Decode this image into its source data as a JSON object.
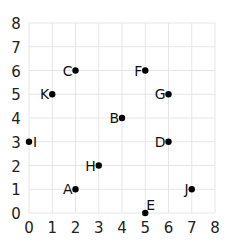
{
  "chart_data": {
    "type": "scatter",
    "title": "",
    "xlabel": "",
    "ylabel": "",
    "xlim": [
      0,
      8
    ],
    "ylim": [
      0,
      8
    ],
    "grid": true,
    "legend": "none",
    "x_ticks": [
      "0",
      "1",
      "2",
      "3",
      "4",
      "5",
      "6",
      "7",
      "8"
    ],
    "y_ticks": [
      "0",
      "1",
      "2",
      "3",
      "4",
      "5",
      "6",
      "7",
      "8"
    ],
    "points": [
      {
        "label": "A",
        "x": 2,
        "y": 1,
        "label_side": "left"
      },
      {
        "label": "B",
        "x": 4,
        "y": 4,
        "label_side": "left"
      },
      {
        "label": "C",
        "x": 2,
        "y": 6,
        "label_side": "left"
      },
      {
        "label": "D",
        "x": 6,
        "y": 3,
        "label_side": "left"
      },
      {
        "label": "E",
        "x": 5,
        "y": 0,
        "label_side": "above-right"
      },
      {
        "label": "F",
        "x": 5,
        "y": 6,
        "label_side": "left"
      },
      {
        "label": "G",
        "x": 6,
        "y": 5,
        "label_side": "left"
      },
      {
        "label": "H",
        "x": 3,
        "y": 2,
        "label_side": "left"
      },
      {
        "label": "I",
        "x": 0,
        "y": 3,
        "label_side": "right"
      },
      {
        "label": "J",
        "x": 7,
        "y": 1,
        "label_side": "left"
      },
      {
        "label": "K",
        "x": 1,
        "y": 5,
        "label_side": "left"
      }
    ],
    "colors": {
      "point": "#000000",
      "grid": "#e6e6e6",
      "text": "#222222"
    }
  }
}
